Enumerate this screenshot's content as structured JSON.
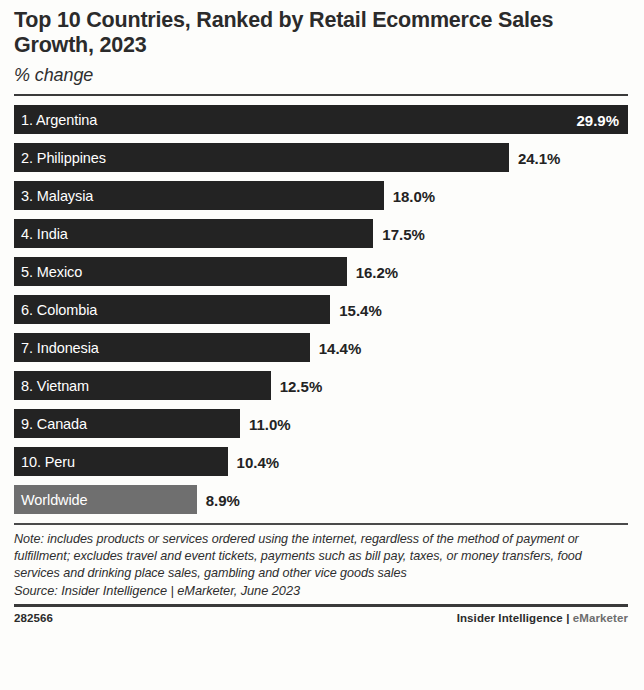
{
  "header": {
    "title": "Top 10 Countries, Ranked by Retail Ecommerce Sales Growth, 2023",
    "subtitle": "% change"
  },
  "chart_data": {
    "type": "bar",
    "orientation": "horizontal",
    "title": "Top 10 Countries, Ranked by Retail Ecommerce Sales Growth, 2023",
    "subtitle": "% change",
    "xlabel": "",
    "ylabel": "",
    "unit": "%",
    "xlim": [
      0,
      29.9
    ],
    "grid": false,
    "legend": false,
    "categories": [
      "1. Argentina",
      "2. Philippines",
      "3. Malaysia",
      "4. India",
      "5. Mexico",
      "6. Colombia",
      "7. Indonesia",
      "8. Vietnam",
      "9. Canada",
      "10. Peru",
      "Worldwide"
    ],
    "values": [
      29.9,
      24.1,
      18.0,
      17.5,
      16.2,
      15.4,
      14.4,
      12.5,
      11.0,
      10.4,
      8.9
    ],
    "value_labels": [
      "29.9%",
      "24.1%",
      "18.0%",
      "17.5%",
      "16.2%",
      "15.4%",
      "14.4%",
      "12.5%",
      "11.0%",
      "10.4%",
      "8.9%"
    ],
    "bars": [
      {
        "label": "1. Argentina",
        "value": 29.9,
        "value_label": "29.9%",
        "highlight": false,
        "label_inside": true,
        "value_inside": true
      },
      {
        "label": "2. Philippines",
        "value": 24.1,
        "value_label": "24.1%",
        "highlight": false,
        "label_inside": true,
        "value_inside": false
      },
      {
        "label": "3. Malaysia",
        "value": 18.0,
        "value_label": "18.0%",
        "highlight": false,
        "label_inside": true,
        "value_inside": false
      },
      {
        "label": "4. India",
        "value": 17.5,
        "value_label": "17.5%",
        "highlight": false,
        "label_inside": true,
        "value_inside": false
      },
      {
        "label": "5. Mexico",
        "value": 16.2,
        "value_label": "16.2%",
        "highlight": false,
        "label_inside": true,
        "value_inside": false
      },
      {
        "label": "6. Colombia",
        "value": 15.4,
        "value_label": "15.4%",
        "highlight": false,
        "label_inside": true,
        "value_inside": false
      },
      {
        "label": "7. Indonesia",
        "value": 14.4,
        "value_label": "14.4%",
        "highlight": false,
        "label_inside": true,
        "value_inside": false
      },
      {
        "label": "8. Vietnam",
        "value": 12.5,
        "value_label": "12.5%",
        "highlight": false,
        "label_inside": true,
        "value_inside": false
      },
      {
        "label": "9. Canada",
        "value": 11.0,
        "value_label": "11.0%",
        "highlight": false,
        "label_inside": true,
        "value_inside": false
      },
      {
        "label": "10. Peru",
        "value": 10.4,
        "value_label": "10.4%",
        "highlight": false,
        "label_inside": true,
        "value_inside": false
      },
      {
        "label": "Worldwide",
        "value": 8.9,
        "value_label": "8.9%",
        "highlight": true,
        "label_inside": true,
        "value_inside": false
      }
    ],
    "colors": {
      "bar": "#232323",
      "bar_highlight": "#6f6f6f",
      "bar_label_text": "#ffffff",
      "value_text": "#232323",
      "background": "#fdfdfb"
    }
  },
  "footnotes": {
    "note": "Note: includes products or services ordered using the internet, regardless of the method of payment or fulfillment; excludes travel and event tickets, payments such as bill pay, taxes, or money transfers, food services and drinking place sales, gambling and other vice goods sales",
    "source": "Source: Insider Intelligence | eMarketer, June 2023"
  },
  "footer": {
    "id": "282566",
    "brand_primary": "Insider Intelligence | ",
    "brand_secondary": "eMarketer"
  }
}
